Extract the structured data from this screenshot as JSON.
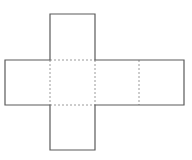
{
  "diagram": {
    "type": "cube-net",
    "colors": {
      "background": "#ffffff",
      "outline": "#5a5a5a",
      "fold": "#9a9a9a"
    },
    "square_size": 45,
    "faces": [
      {
        "id": "top",
        "x": 50,
        "y": 14
      },
      {
        "id": "left",
        "x": 5,
        "y": 60
      },
      {
        "id": "center",
        "x": 50,
        "y": 60
      },
      {
        "id": "right",
        "x": 95,
        "y": 60
      },
      {
        "id": "far-right",
        "x": 139,
        "y": 60
      },
      {
        "id": "bottom",
        "x": 50,
        "y": 105
      }
    ],
    "outline_path": "M50,14 H95 V60 H184 V105 H95 V150 H50 V105 H5 V60 H50 Z",
    "fold_lines": [
      {
        "x1": 50,
        "y1": 60,
        "x2": 95,
        "y2": 60
      },
      {
        "x1": 50,
        "y1": 105,
        "x2": 95,
        "y2": 105
      },
      {
        "x1": 50,
        "y1": 60,
        "x2": 50,
        "y2": 105
      },
      {
        "x1": 95,
        "y1": 60,
        "x2": 95,
        "y2": 105
      },
      {
        "x1": 139,
        "y1": 60,
        "x2": 139,
        "y2": 105
      }
    ]
  }
}
